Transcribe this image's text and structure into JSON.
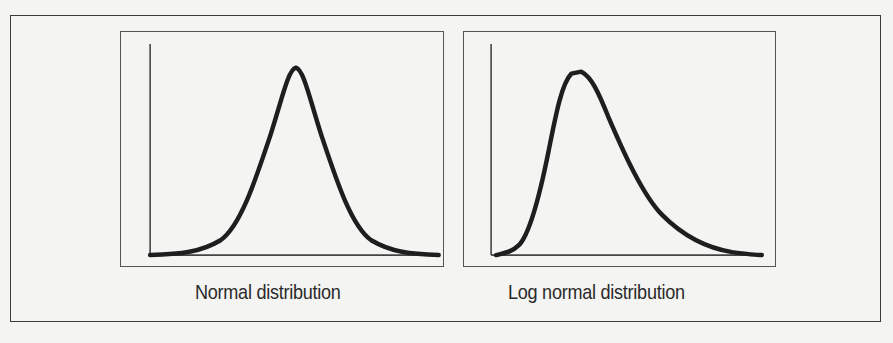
{
  "figure": {
    "panels": [
      {
        "id": "normal",
        "caption": "Normal distribution",
        "shape": "symmetric bell curve"
      },
      {
        "id": "lognormal",
        "caption": "Log normal distribution",
        "shape": "right-skewed bell curve"
      }
    ],
    "colors": {
      "background": "#f4f4f2",
      "frame": "#3a3a3a",
      "curve": "#1e1e1e",
      "axis": "#444444"
    }
  }
}
